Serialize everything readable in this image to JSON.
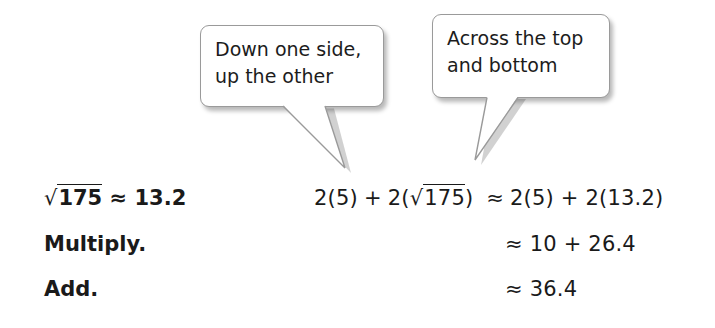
{
  "callouts": [
    {
      "id": "callout-1",
      "lines": [
        "Down one side,",
        "up the other"
      ]
    },
    {
      "id": "callout-2",
      "lines": [
        "Across the top",
        "and bottom"
      ]
    }
  ],
  "steps": [
    {
      "label_parts": {
        "radical": "√",
        "radicand": "175",
        "rest": " ≈ 13.2"
      },
      "expression": {
        "lhs_a": "2(5)",
        "plus": "+",
        "lhs_b_open": "2(",
        "radical": "√",
        "radicand": "175",
        "lhs_b_close": ")",
        "approx": "≈",
        "rhs": "2(5) + 2(13.2)"
      }
    },
    {
      "label": "Multiply.",
      "approx": "≈",
      "expression": "10 + 26.4"
    },
    {
      "label": "Add.",
      "approx": "≈",
      "expression": "36.4"
    }
  ],
  "colors": {
    "text": "#1a1a1a",
    "callout_border": "#9a9a9a",
    "background": "#ffffff"
  }
}
